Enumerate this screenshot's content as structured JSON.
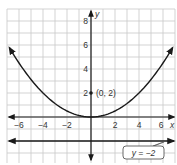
{
  "chart_data": {
    "type": "line",
    "title": "",
    "xlabel": "x",
    "ylabel": "y",
    "xlim": [
      -7,
      7
    ],
    "ylim": [
      -3.7,
      9
    ],
    "grid": true,
    "x_ticks": [
      -6,
      -4,
      -2,
      2,
      4,
      6
    ],
    "y_ticks": [
      2,
      4,
      6,
      8
    ],
    "x_tick_labels": [
      "−6",
      "−4",
      "−2",
      "2",
      "4",
      "6"
    ],
    "y_tick_labels": [
      "2",
      "4",
      "6",
      "8"
    ],
    "series": [
      {
        "name": "parabola",
        "equation": "y = x^2 / 8",
        "x": [
          -7,
          -6,
          -4,
          -2,
          0,
          2,
          4,
          6,
          7
        ],
        "y": [
          6.125,
          4.5,
          2,
          0.5,
          0,
          0.5,
          2,
          4.5,
          6.125
        ],
        "arrows": "both"
      },
      {
        "name": "directrix",
        "equation": "y = -2",
        "x": [
          -7,
          7
        ],
        "y": [
          -2,
          -2
        ],
        "arrows": "both"
      }
    ],
    "points": [
      {
        "label": "(0, 2)",
        "x": 0,
        "y": 2,
        "name": "focus"
      }
    ],
    "annotations": [
      {
        "text": "y = −2",
        "target": "directrix",
        "boxed": true
      }
    ]
  },
  "labels": {
    "x_axis": "x",
    "y_axis": "y",
    "focus": "(0, 2)",
    "directrix": "y = −2",
    "xt0": "−6",
    "xt1": "−4",
    "xt2": "−2",
    "xt3": "2",
    "xt4": "4",
    "xt5": "6",
    "yt0": "2",
    "yt1": "4",
    "yt2": "6",
    "yt3": "8"
  },
  "colors": {
    "grid": "#c8c8c8",
    "axis": "#1a1a1a",
    "curve": "#1a1a1a",
    "background": "#ffffff"
  }
}
